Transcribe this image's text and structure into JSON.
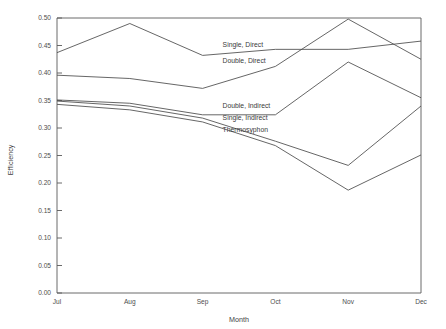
{
  "chart_data": {
    "type": "line",
    "title": "",
    "xlabel": "Month",
    "ylabel": "Efficiency",
    "categories": [
      "Jul",
      "Aug",
      "Sep",
      "Oct",
      "Nov",
      "Dec"
    ],
    "x_tick_labels": [
      "Jul",
      "Aug",
      "Sep",
      "Oct",
      "Nov",
      "Dec"
    ],
    "y_tick_labels": [
      "0.00",
      "0.05",
      "0.10",
      "0.15",
      "0.20",
      "0.25",
      "0.30",
      "0.35",
      "0.40",
      "0.45",
      "0.50"
    ],
    "y_ticks": [
      0.0,
      0.05,
      0.1,
      0.15,
      0.2,
      0.25,
      0.3,
      0.35,
      0.4,
      0.45,
      0.5
    ],
    "ylim": [
      0.0,
      0.5
    ],
    "grid": false,
    "legend": "inline-annotations",
    "line_color": "#4a4a4a",
    "series": [
      {
        "name": "Single, Direct",
        "values": [
          0.437,
          0.49,
          0.432,
          0.443,
          0.443,
          0.458
        ]
      },
      {
        "name": "Double, Direct",
        "values": [
          0.396,
          0.39,
          0.372,
          0.412,
          0.498,
          0.425
        ]
      },
      {
        "name": "Double, Indirect",
        "values": [
          0.351,
          0.345,
          0.324,
          0.324,
          0.42,
          0.355
        ]
      },
      {
        "name": "Single, Indirect",
        "values": [
          0.349,
          0.34,
          0.318,
          0.276,
          0.232,
          0.34
        ]
      },
      {
        "name": "Thermosyphon",
        "values": [
          0.343,
          0.333,
          0.311,
          0.268,
          0.187,
          0.251
        ]
      }
    ],
    "annotations": [
      {
        "text": "Single, Direct",
        "x_frac": 0.455,
        "value": 0.447
      },
      {
        "text": "Double, Direct",
        "x_frac": 0.455,
        "value": 0.419
      },
      {
        "text": "Double, Indirect",
        "x_frac": 0.455,
        "value": 0.337
      },
      {
        "text": "Single, Indirect",
        "x_frac": 0.455,
        "value": 0.315
      },
      {
        "text": "Thermosyphon",
        "x_frac": 0.455,
        "value": 0.293
      }
    ]
  }
}
